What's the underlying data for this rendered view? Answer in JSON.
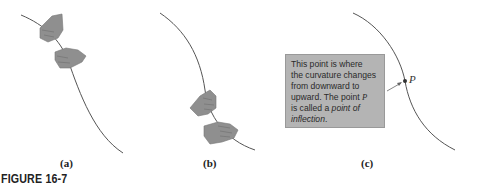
{
  "figure": {
    "caption": "FIGURE 16-7",
    "panels": [
      {
        "label": "(a)",
        "description": "Curve concave upward, hands gripping the top of the rope"
      },
      {
        "label": "(b)",
        "description": "Curve concave downward, hands gripping the bottom of the rope"
      },
      {
        "label": "(c)",
        "description": "Curve with inflection point P"
      }
    ],
    "note": {
      "line1": "This point is where",
      "line2": "the curvature changes",
      "line3": "from downward to",
      "line4_prefix": "upward. The point ",
      "line4_var": "P",
      "line5_prefix": "is called a ",
      "line5_em": "point of",
      "line6_em": "inflection",
      "line6_suffix": "."
    },
    "point_label": "P",
    "colors": {
      "curve": "#555555",
      "hand": "#8f8f8f",
      "box": "#b4b4b4"
    }
  }
}
